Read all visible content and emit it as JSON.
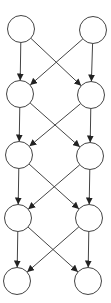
{
  "diagram": {
    "type": "layered-directed-graph",
    "stroke_color": "#444444",
    "fill_color": "#ffffff",
    "node_radius": 13.5,
    "nodes": [
      {
        "id": "r1l",
        "x": 21,
        "y": 29
      },
      {
        "id": "r1r",
        "x": 93,
        "y": 30
      },
      {
        "id": "r2l",
        "x": 20,
        "y": 94
      },
      {
        "id": "r2r",
        "x": 91,
        "y": 95
      },
      {
        "id": "r3l",
        "x": 19,
        "y": 155
      },
      {
        "id": "r3r",
        "x": 90,
        "y": 156
      },
      {
        "id": "r4l",
        "x": 18,
        "y": 218
      },
      {
        "id": "r4r",
        "x": 89,
        "y": 218
      },
      {
        "id": "r5l",
        "x": 17,
        "y": 281
      },
      {
        "id": "r5r",
        "x": 88,
        "y": 281
      }
    ],
    "edges": [
      {
        "from": "r1l",
        "to": "r2l"
      },
      {
        "from": "r1l",
        "to": "r2r"
      },
      {
        "from": "r1r",
        "to": "r2l"
      },
      {
        "from": "r1r",
        "to": "r2r"
      },
      {
        "from": "r2l",
        "to": "r3l"
      },
      {
        "from": "r2l",
        "to": "r3r"
      },
      {
        "from": "r2r",
        "to": "r3l"
      },
      {
        "from": "r2r",
        "to": "r3r"
      },
      {
        "from": "r3l",
        "to": "r4l"
      },
      {
        "from": "r3l",
        "to": "r4r"
      },
      {
        "from": "r3r",
        "to": "r4l"
      },
      {
        "from": "r3r",
        "to": "r4r"
      },
      {
        "from": "r4l",
        "to": "r5l"
      },
      {
        "from": "r4l",
        "to": "r5r"
      },
      {
        "from": "r4r",
        "to": "r5l"
      },
      {
        "from": "r4r",
        "to": "r5r"
      }
    ]
  }
}
